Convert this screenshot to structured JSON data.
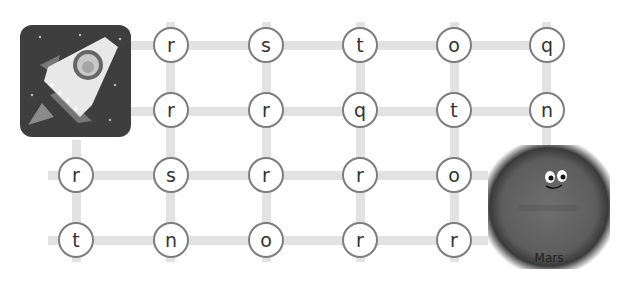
{
  "game": {
    "start": {
      "label": "rocket",
      "icon": "rocket-icon"
    },
    "goal": {
      "label": "Mars",
      "icon": "mars-planet-icon"
    },
    "grid": {
      "rows": [
        [
          "",
          "r",
          "s",
          "t",
          "o",
          "q"
        ],
        [
          "",
          "r",
          "r",
          "q",
          "t",
          "n"
        ],
        [
          "r",
          "s",
          "r",
          "r",
          "o",
          ""
        ],
        [
          "t",
          "n",
          "o",
          "r",
          "r",
          ""
        ]
      ]
    }
  }
}
